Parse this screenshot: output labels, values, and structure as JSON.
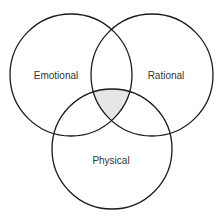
{
  "diagram": {
    "type": "venn",
    "sets": [
      {
        "id": "emotional",
        "label": "Emotional",
        "cx": 71,
        "cy": 75,
        "r": 61
      },
      {
        "id": "rational",
        "label": "Rational",
        "cx": 152,
        "cy": 75,
        "r": 61
      },
      {
        "id": "physical",
        "label": "Physical",
        "cx": 112,
        "cy": 149,
        "r": 60
      }
    ],
    "intersection": {
      "sets": [
        "emotional",
        "rational",
        "physical"
      ],
      "fill": "#e6e6e6",
      "shaded": true
    },
    "colors": {
      "stroke": "#1a1a1a",
      "text": "#333333",
      "background": "#ffffff"
    }
  }
}
